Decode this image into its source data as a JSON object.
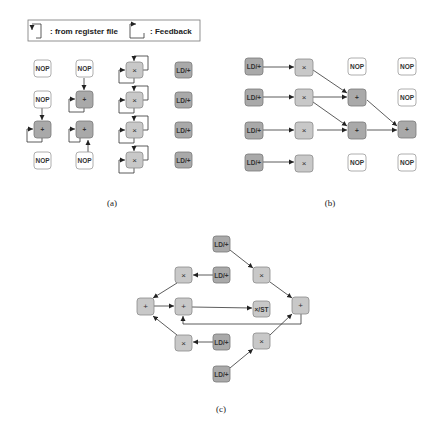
{
  "legend": {
    "register_file_label": ": from register file",
    "feedback_label": ": Feedback",
    "register_file_icon": "arrow-down-bracket-icon",
    "feedback_icon": "arrow-right-bracket-icon"
  },
  "captions": {
    "a": "(a)",
    "b": "(b)",
    "c": "(c)"
  },
  "panel_a": {
    "nodes": [
      {
        "id": "a00",
        "label": "NOP",
        "type": "nop"
      },
      {
        "id": "a10",
        "label": "NOP",
        "type": "nop"
      },
      {
        "id": "a20",
        "label": "+",
        "type": "dark"
      },
      {
        "id": "a30",
        "label": "NOP",
        "type": "nop"
      },
      {
        "id": "a01",
        "label": "NOP",
        "type": "nop"
      },
      {
        "id": "a11",
        "label": "+",
        "type": "dark"
      },
      {
        "id": "a21",
        "label": "+",
        "type": "dark"
      },
      {
        "id": "a31",
        "label": "NOP",
        "type": "nop"
      },
      {
        "id": "a02",
        "label": "×",
        "type": "op"
      },
      {
        "id": "a12",
        "label": "×",
        "type": "op"
      },
      {
        "id": "a22",
        "label": "×",
        "type": "op"
      },
      {
        "id": "a32",
        "label": "×",
        "type": "op"
      },
      {
        "id": "a03",
        "label": "LD/+",
        "type": "dark"
      },
      {
        "id": "a13",
        "label": "LD/+",
        "type": "dark"
      },
      {
        "id": "a23",
        "label": "LD/+",
        "type": "dark"
      },
      {
        "id": "a33",
        "label": "LD/+",
        "type": "dark"
      }
    ]
  },
  "panel_b": {
    "nodes": [
      {
        "id": "b00",
        "label": "LD/+",
        "type": "dark"
      },
      {
        "id": "b10",
        "label": "LD/+",
        "type": "dark"
      },
      {
        "id": "b20",
        "label": "LD/+",
        "type": "dark"
      },
      {
        "id": "b30",
        "label": "LD/+",
        "type": "dark"
      },
      {
        "id": "b01",
        "label": "×",
        "type": "op"
      },
      {
        "id": "b11",
        "label": "×",
        "type": "op"
      },
      {
        "id": "b21",
        "label": "×",
        "type": "op"
      },
      {
        "id": "b31",
        "label": "×",
        "type": "op"
      },
      {
        "id": "b02",
        "label": "NOP",
        "type": "nop"
      },
      {
        "id": "b12",
        "label": "+",
        "type": "dark"
      },
      {
        "id": "b22",
        "label": "+",
        "type": "dark"
      },
      {
        "id": "b32",
        "label": "NOP",
        "type": "nop"
      },
      {
        "id": "b03",
        "label": "NOP",
        "type": "nop"
      },
      {
        "id": "b13",
        "label": "NOP",
        "type": "nop"
      },
      {
        "id": "b23",
        "label": "+",
        "type": "dark"
      },
      {
        "id": "b33",
        "label": "NOP",
        "type": "nop"
      }
    ]
  },
  "panel_c": {
    "nodes": [
      {
        "id": "c_ld_top",
        "label": "LD/+",
        "type": "dark"
      },
      {
        "id": "c_mul_tl",
        "label": "×",
        "type": "op"
      },
      {
        "id": "c_ld_ml",
        "label": "LD/+",
        "type": "dark"
      },
      {
        "id": "c_mul_tr",
        "label": "×",
        "type": "op"
      },
      {
        "id": "c_add_l",
        "label": "+",
        "type": "op"
      },
      {
        "id": "c_add_c",
        "label": "+",
        "type": "op"
      },
      {
        "id": "c_mulst",
        "label": "×/ST",
        "type": "op"
      },
      {
        "id": "c_add_r",
        "label": "+",
        "type": "op"
      },
      {
        "id": "c_mul_bl",
        "label": "×",
        "type": "op"
      },
      {
        "id": "c_ld_bm",
        "label": "LD/+",
        "type": "dark"
      },
      {
        "id": "c_mul_br",
        "label": "×",
        "type": "op"
      },
      {
        "id": "c_ld_bot",
        "label": "LD/+",
        "type": "dark"
      }
    ]
  }
}
